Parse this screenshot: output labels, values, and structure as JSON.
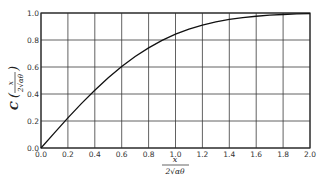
{
  "chart_data": {
    "type": "line",
    "title": "",
    "xlabel": "x / 2√(αθ)",
    "ylabel": "C(x / 2√(αθ))",
    "xlabel_parts": {
      "numerator": "x",
      "denominator": "2√αθ"
    },
    "ylabel_parts": {
      "func": "C",
      "numerator": "x",
      "denominator": "2√αθ"
    },
    "xlim": [
      0.0,
      2.0
    ],
    "ylim": [
      0.0,
      1.0
    ],
    "grid": true,
    "legend": "none",
    "x_ticks": [
      "0.0",
      "0.2",
      "0.4",
      "0.6",
      "0.8",
      "1.0",
      "1.2",
      "1.4",
      "1.6",
      "1.8",
      "2.0"
    ],
    "y_ticks": [
      "0.0",
      "0.2",
      "0.4",
      "0.6",
      "0.8",
      "1.0"
    ],
    "series": [
      {
        "name": "C",
        "x": [
          0.0,
          0.1,
          0.2,
          0.3,
          0.4,
          0.5,
          0.6,
          0.7,
          0.8,
          0.9,
          1.0,
          1.1,
          1.2,
          1.3,
          1.4,
          1.5,
          1.6,
          1.7,
          1.8,
          1.9,
          2.0
        ],
        "values": [
          0.0,
          0.112,
          0.223,
          0.329,
          0.428,
          0.52,
          0.604,
          0.678,
          0.742,
          0.797,
          0.843,
          0.88,
          0.91,
          0.934,
          0.952,
          0.966,
          0.976,
          0.984,
          0.989,
          0.993,
          0.995
        ]
      }
    ]
  },
  "plot": {
    "left": 41,
    "top": 13,
    "right": 310,
    "bottom": 148
  },
  "colors": {
    "grid": "#3a3a3a",
    "curve": "#111111",
    "frame": "#2a2a2a"
  }
}
